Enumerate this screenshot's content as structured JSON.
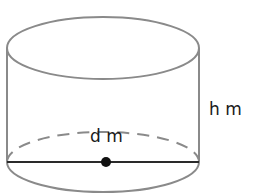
{
  "figure": {
    "type": "cylinder",
    "labels": {
      "diameter": "d m",
      "height": "h m"
    },
    "colors": {
      "outline": "#8a8a8a",
      "diameter_line": "#2a2a2a",
      "center_dot": "#111111",
      "label": "#1a1a1a",
      "background": "#ffffff"
    }
  }
}
